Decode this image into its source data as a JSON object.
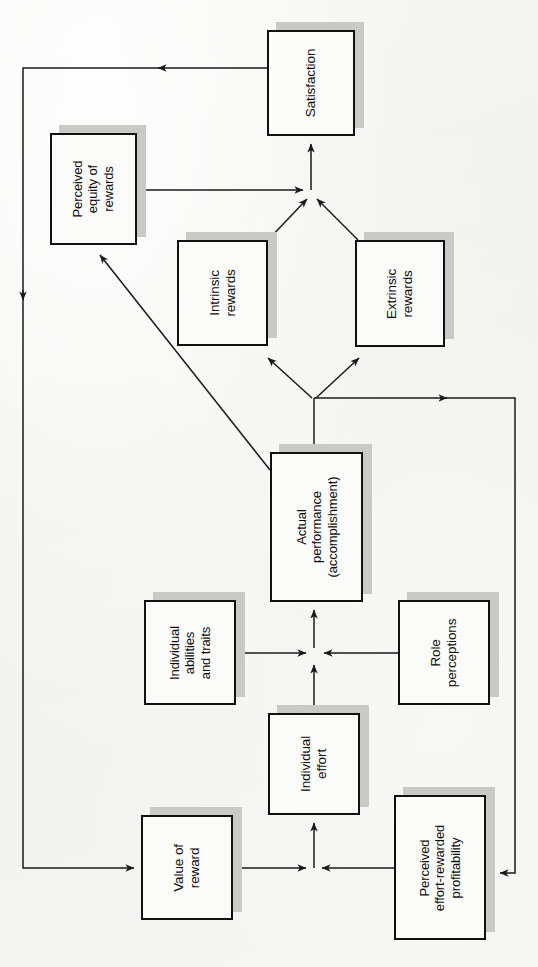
{
  "figure": {
    "caption": "",
    "orientation": "rotated-90-counterclockwise",
    "background_color": "#f4f4f2",
    "box_fill": "#fbfbfa",
    "box_border_color": "#111111",
    "box_shadow_color": "#c9c9c6",
    "line_color": "#1a1a1a"
  },
  "nodes": [
    {
      "id": "satisfaction",
      "label": "Satisfaction"
    },
    {
      "id": "perceived-equity",
      "label": "Perceived\nequity of\nrewards"
    },
    {
      "id": "intrinsic-rewards",
      "label": "Intrinsic\nrewards"
    },
    {
      "id": "extrinsic-rewards",
      "label": "Extrinsic\nrewards"
    },
    {
      "id": "actual-performance",
      "label": "Actual\nperformance\n(accomplishment)"
    },
    {
      "id": "individual-abilities",
      "label": "Individual\nabilities\nand traits"
    },
    {
      "id": "role-perceptions",
      "label": "Role\nperceptions"
    },
    {
      "id": "individual-effort",
      "label": "Individual\neffort"
    },
    {
      "id": "value-of-reward",
      "label": "Value of\nreward"
    },
    {
      "id": "perceived-effort-reward",
      "label": "Perceived\neffort-rewarded\nprofitability"
    }
  ],
  "labels": {
    "satisfaction": {
      "line1": "Satisfaction"
    },
    "perceived_equity": {
      "line1": "Perceived",
      "line2": "equity of",
      "line3": "rewards"
    },
    "intrinsic_rewards": {
      "line1": "Intrinsic",
      "line2": "rewards"
    },
    "extrinsic_rewards": {
      "line1": "Extrinsic",
      "line2": "rewards"
    },
    "actual_performance": {
      "line1": "Actual",
      "line2": "performance",
      "line3": "(accomplishment)"
    },
    "individual_abilities": {
      "line1": "Individual",
      "line2": "abilities",
      "line3": "and traits"
    },
    "role_perceptions": {
      "line1": "Role",
      "line2": "perceptions"
    },
    "individual_effort": {
      "line1": "Individual",
      "line2": "effort"
    },
    "value_of_reward": {
      "line1": "Value of",
      "line2": "reward"
    },
    "perceived_effort_reward": {
      "line1": "Perceived",
      "line2": "effort-rewarded",
      "line3": "profitability"
    }
  },
  "edges": [
    {
      "from": "value-of-reward",
      "to": "individual-effort",
      "type": "straight"
    },
    {
      "from": "perceived-effort-reward",
      "to": "individual-effort",
      "type": "straight"
    },
    {
      "from": "individual-effort",
      "to": "actual-performance",
      "type": "straight"
    },
    {
      "from": "individual-abilities",
      "to": "actual-performance",
      "type": "straight"
    },
    {
      "from": "role-perceptions",
      "to": "actual-performance",
      "type": "straight"
    },
    {
      "from": "actual-performance",
      "to": "intrinsic-rewards",
      "type": "diagonal"
    },
    {
      "from": "actual-performance",
      "to": "extrinsic-rewards",
      "type": "diagonal"
    },
    {
      "from": "actual-performance",
      "to": "perceived-equity",
      "type": "diagonal"
    },
    {
      "from": "actual-performance",
      "to": "perceived-effort-reward",
      "type": "feedback-right"
    },
    {
      "from": "intrinsic-rewards",
      "to": "satisfaction",
      "type": "diagonal"
    },
    {
      "from": "extrinsic-rewards",
      "to": "satisfaction",
      "type": "diagonal"
    },
    {
      "from": "perceived-equity",
      "to": "satisfaction",
      "type": "straight"
    },
    {
      "from": "satisfaction",
      "to": "value-of-reward",
      "type": "feedback-left"
    }
  ]
}
